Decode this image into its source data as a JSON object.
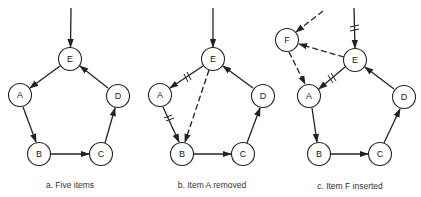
{
  "figure": {
    "panels": [
      {
        "id": "a",
        "caption": "a. Five items",
        "nodes": [
          {
            "label": "E",
            "x": 70,
            "y": 59
          },
          {
            "label": "A",
            "x": 20,
            "y": 95
          },
          {
            "label": "D",
            "x": 118,
            "y": 96
          },
          {
            "label": "B",
            "x": 39,
            "y": 154
          },
          {
            "label": "C",
            "x": 101,
            "y": 154
          }
        ],
        "edges": [
          {
            "from": "entry",
            "to": "E",
            "style": "solid",
            "cut": false
          },
          {
            "from": "E",
            "to": "A",
            "style": "solid",
            "cut": false
          },
          {
            "from": "A",
            "to": "B",
            "style": "solid",
            "cut": false
          },
          {
            "from": "B",
            "to": "C",
            "style": "solid",
            "cut": false
          },
          {
            "from": "C",
            "to": "D",
            "style": "solid",
            "cut": false
          },
          {
            "from": "D",
            "to": "E",
            "style": "solid",
            "cut": false
          }
        ]
      },
      {
        "id": "b",
        "caption": "b. Item A removed",
        "nodes": [
          {
            "label": "E",
            "x": 213,
            "y": 59
          },
          {
            "label": "A",
            "x": 160,
            "y": 95
          },
          {
            "label": "D",
            "x": 263,
            "y": 96
          },
          {
            "label": "B",
            "x": 182,
            "y": 154
          },
          {
            "label": "C",
            "x": 243,
            "y": 154
          }
        ],
        "edges": [
          {
            "from": "entry",
            "to": "E",
            "style": "solid",
            "cut": false
          },
          {
            "from": "E",
            "to": "A",
            "style": "solid",
            "cut": true
          },
          {
            "from": "A",
            "to": "B",
            "style": "solid",
            "cut": true
          },
          {
            "from": "E",
            "to": "B",
            "style": "dashed",
            "cut": false
          },
          {
            "from": "B",
            "to": "C",
            "style": "solid",
            "cut": false
          },
          {
            "from": "C",
            "to": "D",
            "style": "solid",
            "cut": false
          },
          {
            "from": "D",
            "to": "E",
            "style": "solid",
            "cut": false
          }
        ]
      },
      {
        "id": "c",
        "caption": "c. Item F inserted",
        "nodes": [
          {
            "label": "F",
            "x": 287,
            "y": 40
          },
          {
            "label": "E",
            "x": 355,
            "y": 60
          },
          {
            "label": "A",
            "x": 309,
            "y": 96
          },
          {
            "label": "D",
            "x": 404,
            "y": 97
          },
          {
            "label": "B",
            "x": 319,
            "y": 154
          },
          {
            "label": "C",
            "x": 380,
            "y": 154
          }
        ],
        "edges": [
          {
            "from": "entry",
            "to": "E",
            "style": "solid",
            "cut": true
          },
          {
            "from": "entry",
            "to": "F",
            "style": "dashed",
            "cut": false
          },
          {
            "from": "E",
            "to": "F",
            "style": "dashed",
            "cut": false
          },
          {
            "from": "F",
            "to": "A",
            "style": "dashed",
            "cut": false
          },
          {
            "from": "E",
            "to": "A",
            "style": "solid",
            "cut": true
          },
          {
            "from": "A",
            "to": "B",
            "style": "solid",
            "cut": false
          },
          {
            "from": "B",
            "to": "C",
            "style": "solid",
            "cut": false
          },
          {
            "from": "C",
            "to": "D",
            "style": "solid",
            "cut": false
          },
          {
            "from": "D",
            "to": "E",
            "style": "solid",
            "cut": false
          }
        ]
      }
    ]
  }
}
